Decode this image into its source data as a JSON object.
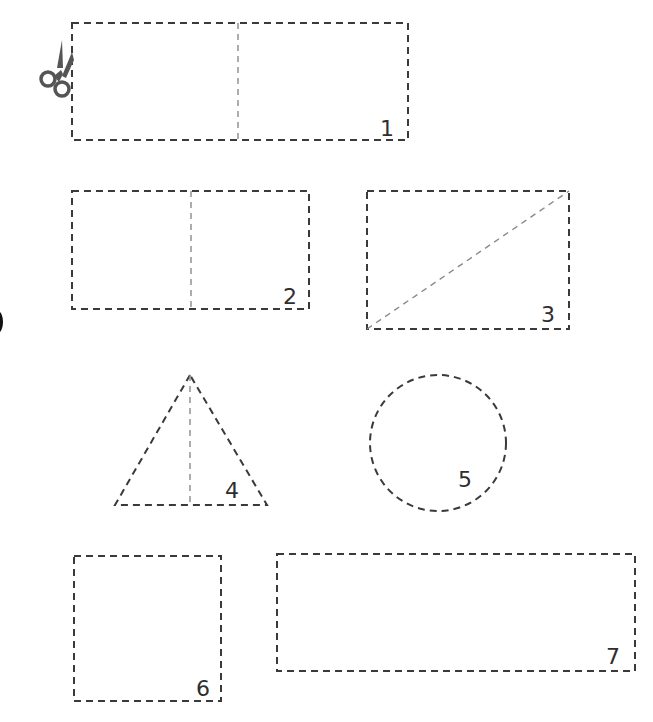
{
  "worksheet": {
    "instruction_icon": "scissors-icon",
    "colors": {
      "cut_line": "#3a3a3a",
      "fold_line": "#8a8a8a",
      "scissors": "#555555",
      "label": "#2e2e2e"
    },
    "shapes": [
      {
        "id": 1,
        "label": "1",
        "type": "rectangle",
        "fold": "vertical-center"
      },
      {
        "id": 2,
        "label": "2",
        "type": "rectangle",
        "fold": "vertical-center"
      },
      {
        "id": 3,
        "label": "3",
        "type": "rectangle",
        "fold": "diagonal"
      },
      {
        "id": 4,
        "label": "4",
        "type": "triangle",
        "fold": "vertical-center"
      },
      {
        "id": 5,
        "label": "5",
        "type": "circle",
        "fold": "none"
      },
      {
        "id": 6,
        "label": "6",
        "type": "rectangle",
        "fold": "none"
      },
      {
        "id": 7,
        "label": "7",
        "type": "rectangle",
        "fold": "none"
      }
    ]
  }
}
